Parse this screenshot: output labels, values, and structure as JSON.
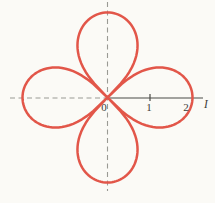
{
  "figure": {
    "background_color": "#fbfaf6"
  },
  "chart_data": {
    "type": "line",
    "subtype": "polar-rose",
    "title": "",
    "petals": 4,
    "petal_axes_deg": [
      0,
      90,
      180,
      270
    ],
    "amplitude": 2,
    "lobe_equation_hint": "r = 2*sqrt(cos(2*theta)) per lobe, lobes centered on +x, +y, -x, -y",
    "x_ticks": [
      1,
      2
    ],
    "x_tick_labels": [
      "1",
      "2"
    ],
    "origin_label": "0",
    "axis_label": "I",
    "axes": {
      "polar_axis_solid_right": true,
      "dashed_horizontal_left": true,
      "dashed_vertical_full": true,
      "grid": false,
      "legend": "none"
    },
    "colors": {
      "curve": "#e25649",
      "axis": "#4a4a46",
      "dashed": "#9a9a94",
      "text": "#3d3d39"
    },
    "layout": {
      "center_x": 107.5,
      "center_y": 97.5,
      "unit_px": 42.5,
      "curve_stroke_width": 2.5,
      "axis_stroke_width": 1.2,
      "dashed_stroke_width": 1.1,
      "dash_pattern": "5 3.5",
      "h_dash_x_start": 10,
      "v_dash_y_start": 2,
      "v_dash_y_end": 191,
      "axis_x_end": 203,
      "tick_top_y": 94,
      "tick_bottom_y": 101,
      "label_0_x": 104,
      "label_0_y": 110.5,
      "label_1_x": 149,
      "label_1_y": 110.5,
      "label_2_x": 186,
      "label_2_y": 111,
      "label_axis_x": 206,
      "label_axis_y": 107.5
    }
  }
}
